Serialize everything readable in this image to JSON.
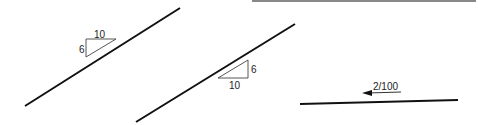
{
  "diagram": {
    "panels": [
      {
        "id": "slope-triangle-above",
        "line": {
          "x1": 25,
          "y1": 106,
          "x2": 180,
          "y2": 8
        },
        "triangle": {
          "rise_label": "6",
          "run_label": "10",
          "position": "above-left"
        }
      },
      {
        "id": "slope-triangle-below",
        "line": {
          "x1": 136,
          "y1": 122,
          "x2": 295,
          "y2": 24
        },
        "triangle": {
          "rise_label": "6",
          "run_label": "10",
          "position": "below-right"
        }
      },
      {
        "id": "slope-ratio-arrow",
        "line": {
          "x1": 300,
          "y1": 104,
          "x2": 458,
          "y2": 100
        },
        "arrow": {
          "label": "2/100",
          "direction": "left"
        }
      }
    ],
    "top_rule": {
      "x1": 252,
      "x2": 476,
      "y": 1,
      "color": "#888888"
    },
    "colors": {
      "line": "#111111",
      "triangle": "#444444",
      "text": "#222222"
    }
  }
}
